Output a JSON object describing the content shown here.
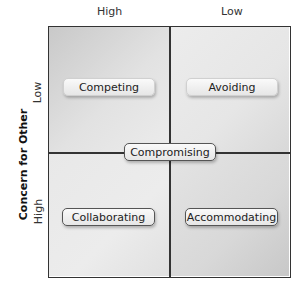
{
  "columns": {
    "left": "High",
    "right": "Low"
  },
  "rows": {
    "top": "Low",
    "bottom": "High"
  },
  "y_axis_title": "Concern for Other",
  "styles": {
    "competing": "Competing",
    "avoiding": "Avoiding",
    "compromising": "Compromising",
    "collaborating": "Collaborating",
    "accommodating": "Accommodating"
  },
  "colors": {
    "border": "#333333",
    "pill_bg": "#f0f0f0"
  }
}
